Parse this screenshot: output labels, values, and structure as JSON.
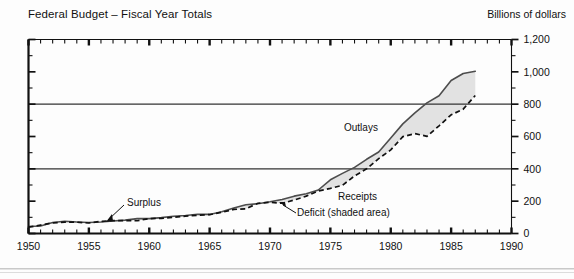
{
  "header": {
    "title": "Federal Budget – Fiscal Year Totals",
    "unit_label": "Billions of dollars"
  },
  "annotations": {
    "outlays": "Outlays",
    "receipts": "Receipts",
    "surplus": "Surplus",
    "deficit": "Deficit (shaded area)"
  },
  "axis": {
    "y_ticks": [
      "0",
      "200",
      "400",
      "600",
      "800",
      "1,000",
      "1,200"
    ],
    "x_ticks": [
      "1950",
      "1955",
      "1960",
      "1965",
      "1970",
      "1975",
      "1980",
      "1985",
      "1990"
    ]
  },
  "colors": {
    "outlays_line": "#4d4d4d",
    "receipts_line": "#111111",
    "deficit_fill": "#e2e2e2",
    "gridline": "#333333",
    "frame": "#111111"
  },
  "chart_data": {
    "type": "area",
    "title": "Federal Budget – Fiscal Year Totals",
    "subtitle": "",
    "xlabel": "",
    "ylabel": "Billions of dollars",
    "xlim": [
      1950,
      1990
    ],
    "ylim": [
      0,
      1200
    ],
    "y_ticks": [
      0,
      200,
      400,
      600,
      800,
      1000,
      1200
    ],
    "x_ticks": [
      1950,
      1955,
      1960,
      1965,
      1970,
      1975,
      1980,
      1985,
      1990
    ],
    "x_minor_tick_interval": 1,
    "gridlines": [
      400,
      800
    ],
    "grid": "horizontal-at-400-and-800",
    "legend": "in-plot annotations",
    "shaded_band": {
      "label": "Deficit (shaded area)",
      "between": [
        "Outlays",
        "Receipts"
      ],
      "fill": "#e2e2e2"
    },
    "x": [
      1950,
      1951,
      1952,
      1953,
      1954,
      1955,
      1956,
      1957,
      1958,
      1959,
      1960,
      1961,
      1962,
      1963,
      1964,
      1965,
      1966,
      1967,
      1968,
      1969,
      1970,
      1971,
      1972,
      1973,
      1974,
      1975,
      1976,
      1977,
      1978,
      1979,
      1980,
      1981,
      1982,
      1983,
      1984,
      1985,
      1986,
      1987
    ],
    "series": [
      {
        "name": "Outlays",
        "style": "solid",
        "values": [
          43,
          46,
          68,
          76,
          71,
          68,
          71,
          77,
          83,
          92,
          92,
          98,
          107,
          111,
          119,
          118,
          135,
          158,
          178,
          184,
          196,
          210,
          231,
          246,
          269,
          332,
          372,
          409,
          459,
          504,
          591,
          678,
          746,
          808,
          852,
          946,
          990,
          1004
        ]
      },
      {
        "name": "Receipts",
        "style": "dashed",
        "values": [
          39,
          52,
          66,
          70,
          70,
          65,
          75,
          80,
          80,
          79,
          92,
          94,
          100,
          107,
          113,
          117,
          131,
          149,
          153,
          187,
          193,
          187,
          207,
          231,
          263,
          279,
          298,
          356,
          400,
          463,
          517,
          599,
          618,
          601,
          666,
          734,
          769,
          854
        ]
      }
    ],
    "notes": [
      "Shaded area between Outlays and Receipts represents the Deficit",
      "Small surpluses occur in early years where Receipts exceed Outlays"
    ]
  }
}
